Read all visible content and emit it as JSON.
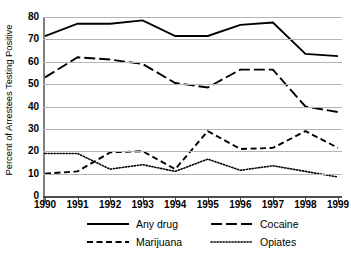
{
  "chart_data": {
    "type": "line",
    "title": "",
    "xlabel": "",
    "ylabel": "Percent of Arrestees Testing Positive",
    "x": [
      1990,
      1991,
      1992,
      1993,
      1994,
      1995,
      1996,
      1997,
      1998,
      1999
    ],
    "xtick_labels": [
      "1990",
      "1991",
      "1992",
      "1993",
      "1994",
      "1995",
      "1996",
      "1997",
      "1998",
      "1999"
    ],
    "ytick_labels": [
      "0",
      "10",
      "20",
      "30",
      "40",
      "50",
      "60",
      "70",
      "80"
    ],
    "yticks": [
      0,
      10,
      20,
      30,
      40,
      50,
      60,
      70,
      80
    ],
    "ylim": [
      0,
      80
    ],
    "xlim": [
      1990,
      1999
    ],
    "grid": "horizontal",
    "legend_position": "bottom",
    "series": [
      {
        "name": "Any drug",
        "style": "solid",
        "color": "#000000",
        "values": [
          71.5,
          77.0,
          77.0,
          78.5,
          71.5,
          71.5,
          76.5,
          77.5,
          63.5,
          62.5
        ]
      },
      {
        "name": "Cocaine",
        "style": "long-dash",
        "color": "#000000",
        "values": [
          53.0,
          62.0,
          61.0,
          59.0,
          50.5,
          48.5,
          56.5,
          56.5,
          40.0,
          37.5
        ]
      },
      {
        "name": "Marijuana",
        "style": "dash",
        "color": "#000000",
        "values": [
          10.0,
          11.0,
          19.5,
          20.0,
          12.0,
          29.0,
          21.0,
          21.5,
          29.0,
          21.5
        ]
      },
      {
        "name": "Opiates",
        "style": "dotted",
        "color": "#000000",
        "values": [
          19.0,
          19.0,
          12.0,
          14.0,
          11.0,
          16.5,
          11.5,
          13.5,
          11.0,
          8.5
        ]
      }
    ]
  },
  "legend": {
    "items": [
      {
        "label": "Any drug",
        "style": "solid"
      },
      {
        "label": "Cocaine",
        "style": "long-dash"
      },
      {
        "label": "Marijuana",
        "style": "dash"
      },
      {
        "label": "Opiates",
        "style": "dotted"
      }
    ]
  }
}
